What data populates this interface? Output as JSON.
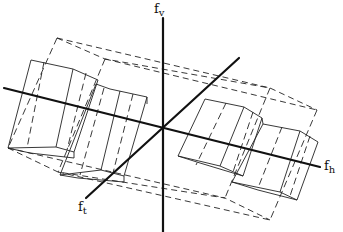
{
  "figure": {
    "axes": {
      "vertical": {
        "name": "f",
        "subscript": "v",
        "from": [
          163,
          18
        ],
        "to": [
          163,
          232
        ]
      },
      "horizontal": {
        "name": "f",
        "subscript": "h",
        "from": [
          4,
          88
        ],
        "to": [
          320,
          167
        ]
      },
      "temporal": {
        "name": "f",
        "subscript": "t",
        "from": [
          86,
          198
        ],
        "to": [
          239,
          58
        ]
      }
    },
    "labels": {
      "fv": {
        "base": "f",
        "sub": "v",
        "x": 153,
        "y": 2
      },
      "fh": {
        "base": "f",
        "sub": "h",
        "x": 325,
        "y": 160
      },
      "ft": {
        "base": "f",
        "sub": "t",
        "x": 79,
        "y": 200
      }
    },
    "solid_boxes": [
      {
        "name": "left-box-1",
        "points": "31,60 73,69 98,80 90,147 67,143 57,150 8,144"
      },
      {
        "name": "left-box-2",
        "points": "98,80 96,87 110,89 147,97 143,158 108,152 84,146 60,141"
      },
      {
        "name": "right-box-1",
        "points": "205,99 244,107 262,118 255,178 215,172 188,165 180,157"
      },
      {
        "name": "right-box-2",
        "points": "262,118 263,126 300,132 318,142 303,198 273,192 245,185 230,180"
      }
    ],
    "dashed_outline": {
      "upper_left_corner": [
        57,
        38
      ],
      "upper_mid_corner": [
        105,
        59
      ],
      "upper_right_corner": [
        270,
        88
      ],
      "right_corner": [
        317,
        110
      ],
      "lower_left_corner": [
        8,
        148
      ],
      "lower_mid_corner": [
        58,
        172
      ],
      "lower_right_mid": [
        225,
        178
      ],
      "lower_right_corner": [
        270,
        220
      ]
    }
  }
}
